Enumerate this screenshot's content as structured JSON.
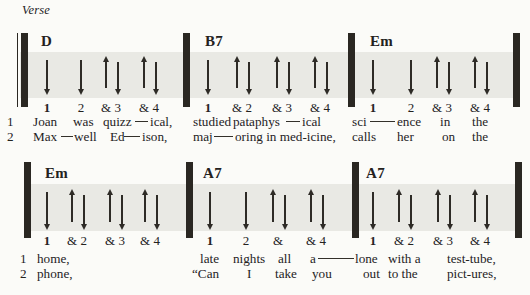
{
  "section_label": "Verse",
  "colors": {
    "page_background": "#fbfbf8",
    "beat_band": "#e9e9e4",
    "ink": "#2a2722"
  },
  "rows": [
    {
      "measures": [
        {
          "chord": "D",
          "beats": [
            {
              "label": "1",
              "strokes": [
                "down"
              ]
            },
            {
              "label": "2",
              "strokes": [
                "down"
              ]
            },
            {
              "label": "& 3",
              "strokes": [
                "up",
                "down"
              ]
            },
            {
              "label": "& 4",
              "strokes": [
                "up",
                "down"
              ]
            }
          ]
        },
        {
          "chord": "B7",
          "beats": [
            {
              "label": "1",
              "strokes": [
                "down"
              ]
            },
            {
              "label": "& 2",
              "strokes": [
                "up",
                "down"
              ]
            },
            {
              "label": "& 3",
              "strokes": [
                "up",
                "down"
              ]
            },
            {
              "label": "& 4",
              "strokes": [
                "up",
                "down"
              ]
            }
          ]
        },
        {
          "chord": "Em",
          "beats": [
            {
              "label": "1",
              "strokes": [
                "down"
              ]
            },
            {
              "label": "2",
              "strokes": [
                "down"
              ]
            },
            {
              "label": "& 3",
              "strokes": [
                "up",
                "down"
              ]
            },
            {
              "label": "& 4",
              "strokes": [
                "up",
                "down"
              ]
            }
          ]
        }
      ],
      "lyrics": [
        {
          "tokens": [
            "1",
            "Joan",
            "was",
            "quizz",
            "—",
            "ical,",
            "studied",
            "pataphys",
            "—",
            "ical",
            "sci",
            "—",
            "ence",
            "in",
            "the"
          ]
        },
        {
          "tokens": [
            "2",
            "Max",
            "—",
            "well",
            "Ed",
            "—",
            "ison,",
            "maj",
            "—",
            "oring in med-icine,",
            "calls",
            "her",
            "on",
            "the"
          ]
        }
      ]
    },
    {
      "measures": [
        {
          "chord": "Em",
          "beats": [
            {
              "label": "1",
              "strokes": [
                "down"
              ]
            },
            {
              "label": "& 2",
              "strokes": [
                "up",
                "down"
              ]
            },
            {
              "label": "& 3",
              "strokes": [
                "up",
                "down"
              ]
            },
            {
              "label": "& 4",
              "strokes": [
                "up",
                "down"
              ]
            }
          ]
        },
        {
          "chord": "A7",
          "beats": [
            {
              "label": "1",
              "strokes": [
                "down"
              ]
            },
            {
              "label": "2",
              "strokes": [
                "down"
              ]
            },
            {
              "label": "&",
              "strokes": [
                "up",
                "down"
              ]
            },
            {
              "label": "& 4",
              "strokes": [
                "up",
                "down"
              ]
            }
          ]
        },
        {
          "chord": "A7",
          "beats": [
            {
              "label": "1",
              "strokes": [
                "down"
              ]
            },
            {
              "label": "& 2",
              "strokes": [
                "up",
                "down"
              ]
            },
            {
              "label": "& 3",
              "strokes": [
                "up",
                "down"
              ]
            },
            {
              "label": "& 4",
              "strokes": [
                "up",
                "down"
              ]
            }
          ]
        }
      ],
      "lyrics": [
        {
          "tokens": [
            "1",
            "home,",
            "late",
            "nights",
            "all",
            "a",
            "—",
            "lone",
            "with a",
            "test-tube,"
          ]
        },
        {
          "tokens": [
            "2",
            "phone,",
            "“Can",
            "I",
            "take",
            "you",
            "out",
            "to the",
            "pict-ures,"
          ]
        }
      ]
    }
  ]
}
